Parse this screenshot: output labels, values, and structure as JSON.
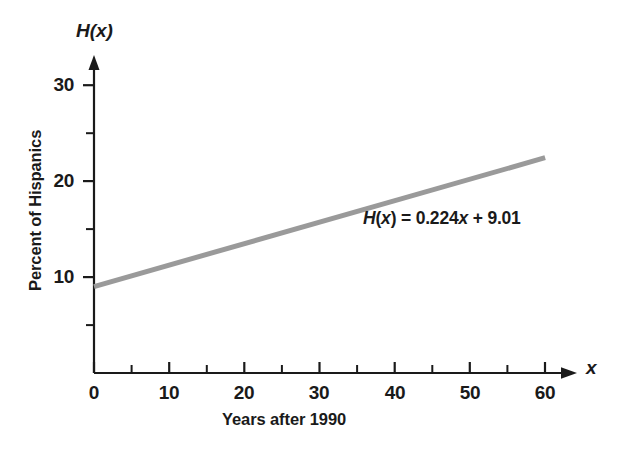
{
  "chart_data": {
    "type": "line",
    "title": "",
    "xlabel": "Years after 1990",
    "ylabel": "Percent of Hispanics",
    "x_axis_name": "x",
    "y_axis_name": "H(x)",
    "xlim": [
      0,
      63
    ],
    "ylim": [
      0,
      33
    ],
    "x_major_ticks": [
      0,
      10,
      20,
      30,
      40,
      50,
      60
    ],
    "x_minor_ticks": [
      5,
      15,
      25,
      35,
      45,
      55
    ],
    "x_tick_labels": [
      "0",
      "10",
      "20",
      "30",
      "40",
      "50",
      "60"
    ],
    "y_major_ticks": [
      10,
      20,
      30
    ],
    "y_minor_ticks": [
      5,
      15,
      25
    ],
    "y_tick_labels": [
      "10",
      "20",
      "30"
    ],
    "grid": false,
    "legend": "none",
    "annotations": [
      {
        "text": "H(x) = 0.224x + 9.01",
        "x": 31,
        "y": 15.2
      }
    ],
    "series": [
      {
        "name": "H(x) = 0.224x + 9.01",
        "type": "line",
        "slope": 0.224,
        "intercept": 9.01,
        "color": "#9a9a9a",
        "line_width": 5,
        "x": [
          0,
          60
        ],
        "values": [
          9.01,
          22.45
        ]
      }
    ]
  },
  "labels": {
    "y_axis_name": "H(x)",
    "x_axis_name": "x",
    "y_axis_title": "Percent of Hispanics",
    "x_axis_title": "Years after 1990",
    "equation": {
      "fn": "H",
      "arg_open": "(",
      "arg": "x",
      "arg_close": ")",
      "equals": "=",
      "slope": "0.224",
      "slope_var": "x",
      "plus": "+",
      "intercept": "9.01",
      "full": "H(x) = 0.224x + 9.01"
    },
    "y_ticks": [
      "30",
      "20",
      "10"
    ],
    "x_ticks": [
      "0",
      "10",
      "20",
      "30",
      "40",
      "50",
      "60"
    ]
  },
  "colors": {
    "background": "#ffffff",
    "axis": "#1a1a1a",
    "text": "#1a1a1a",
    "line": "#9a9a9a"
  }
}
